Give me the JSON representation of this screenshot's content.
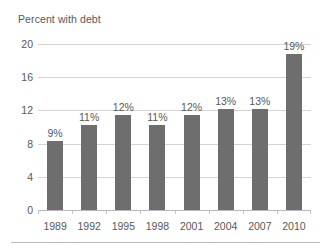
{
  "chart_data": {
    "type": "bar",
    "title": "Percent with debt",
    "xlabel": "",
    "ylabel": "",
    "categories": [
      "1989",
      "1992",
      "1995",
      "1998",
      "2001",
      "2004",
      "2007",
      "2010"
    ],
    "values": [
      8.3,
      10.3,
      11.5,
      10.3,
      11.4,
      12.2,
      12.2,
      18.8
    ],
    "data_labels": [
      "9%",
      "11%",
      "12%",
      "11%",
      "12%",
      "13%",
      "13%",
      "19%"
    ],
    "ylim": [
      0,
      20
    ],
    "yticks": [
      0,
      4,
      8,
      12,
      16,
      20
    ],
    "ytick_labels": [
      "0",
      "4",
      "8",
      "12",
      "16",
      "20"
    ],
    "grid": true,
    "legend": "none",
    "bar_color": "#6e6e6e",
    "gridline_color": "#d4d4d6",
    "text_color": "#58585a"
  }
}
